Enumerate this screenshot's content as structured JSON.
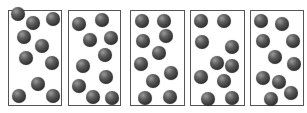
{
  "diagram": {
    "ball_color": "#3a3a3a",
    "border_color": "#555555",
    "boxes": [
      {
        "left": 8,
        "width": 54,
        "particles": [
          [
            9,
            13
          ],
          [
            24,
            22
          ],
          [
            44,
            18
          ],
          [
            15,
            36
          ],
          [
            33,
            45
          ],
          [
            17,
            57
          ],
          [
            43,
            62
          ],
          [
            29,
            83
          ],
          [
            10,
            95
          ],
          [
            44,
            95
          ]
        ]
      },
      {
        "left": 68,
        "width": 53,
        "particles": [
          [
            10,
            23
          ],
          [
            33,
            19
          ],
          [
            21,
            39
          ],
          [
            42,
            37
          ],
          [
            36,
            54
          ],
          [
            14,
            65
          ],
          [
            37,
            76
          ],
          [
            10,
            85
          ],
          [
            24,
            96
          ],
          [
            43,
            97
          ]
        ]
      },
      {
        "left": 130,
        "width": 55,
        "particles": [
          [
            11,
            20
          ],
          [
            33,
            20
          ],
          [
            12,
            40
          ],
          [
            35,
            35
          ],
          [
            28,
            52
          ],
          [
            10,
            63
          ],
          [
            40,
            72
          ],
          [
            22,
            80
          ],
          [
            14,
            97
          ],
          [
            39,
            96
          ]
        ]
      },
      {
        "left": 190,
        "width": 55,
        "particles": [
          [
            10,
            20
          ],
          [
            33,
            20
          ],
          [
            11,
            41
          ],
          [
            41,
            46
          ],
          [
            26,
            62
          ],
          [
            41,
            65
          ],
          [
            10,
            76
          ],
          [
            33,
            80
          ],
          [
            17,
            98
          ],
          [
            41,
            97
          ]
        ]
      },
      {
        "left": 250,
        "width": 54,
        "particles": [
          [
            10,
            20
          ],
          [
            31,
            23
          ],
          [
            12,
            40
          ],
          [
            42,
            40
          ],
          [
            24,
            56
          ],
          [
            43,
            63
          ],
          [
            12,
            77
          ],
          [
            28,
            81
          ],
          [
            40,
            92
          ],
          [
            20,
            98
          ]
        ]
      }
    ]
  }
}
